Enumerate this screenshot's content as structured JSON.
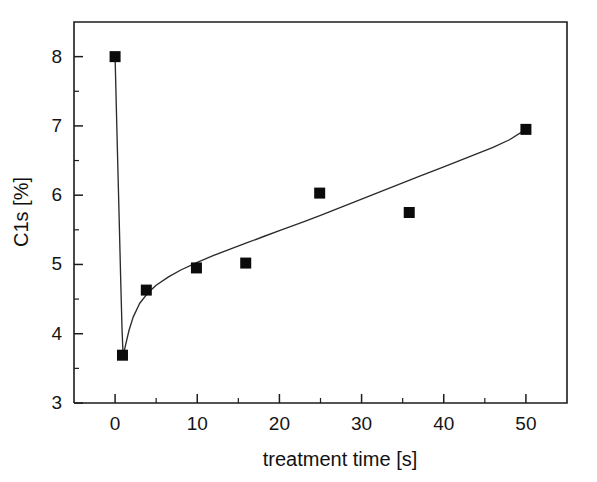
{
  "chart_data": {
    "type": "scatter",
    "title": "",
    "xlabel": "treatment time [s]",
    "ylabel": "C1s [%]",
    "xlim": [
      -5,
      55
    ],
    "ylim": [
      3,
      8.5
    ],
    "grid": false,
    "legend": null,
    "x_ticks": [
      0,
      10,
      20,
      30,
      40,
      50
    ],
    "x_tick_labels": [
      "0",
      "10",
      "20",
      "30",
      "40",
      "50"
    ],
    "x_minor_ticks": [
      5,
      15,
      25,
      35,
      45
    ],
    "y_ticks": [
      3,
      4,
      5,
      6,
      7,
      8
    ],
    "y_tick_labels": [
      "3",
      "4",
      "5",
      "6",
      "7",
      "8"
    ],
    "y_minor_ticks": [
      3.5,
      4.5,
      5.5,
      6.5,
      7.5
    ],
    "marker": "filled-square",
    "marker_color": "#0b0b0b",
    "line_color": "#2b2b2b",
    "points": [
      {
        "x": 0.0,
        "y": 8.0
      },
      {
        "x": 0.9,
        "y": 3.69
      },
      {
        "x": 3.8,
        "y": 4.63
      },
      {
        "x": 9.9,
        "y": 4.95
      },
      {
        "x": 15.9,
        "y": 5.02
      },
      {
        "x": 24.9,
        "y": 6.03
      },
      {
        "x": 35.8,
        "y": 5.75
      },
      {
        "x": 50.0,
        "y": 6.95
      }
    ],
    "fit_curve": [
      {
        "x": 0.0,
        "y": 8.0
      },
      {
        "x": 0.25,
        "y": 6.8
      },
      {
        "x": 0.5,
        "y": 5.65
      },
      {
        "x": 0.7,
        "y": 4.7
      },
      {
        "x": 0.85,
        "y": 4.05
      },
      {
        "x": 0.95,
        "y": 3.76
      },
      {
        "x": 1.0,
        "y": 3.69
      },
      {
        "x": 1.3,
        "y": 3.85
      },
      {
        "x": 1.7,
        "y": 4.05
      },
      {
        "x": 2.2,
        "y": 4.24
      },
      {
        "x": 3.0,
        "y": 4.44
      },
      {
        "x": 4.0,
        "y": 4.59
      },
      {
        "x": 5.0,
        "y": 4.7
      },
      {
        "x": 6.5,
        "y": 4.82
      },
      {
        "x": 8.0,
        "y": 4.92
      },
      {
        "x": 10.0,
        "y": 5.03
      },
      {
        "x": 12.0,
        "y": 5.13
      },
      {
        "x": 14.0,
        "y": 5.22
      },
      {
        "x": 16.0,
        "y": 5.31
      },
      {
        "x": 18.0,
        "y": 5.4
      },
      {
        "x": 20.0,
        "y": 5.49
      },
      {
        "x": 23.0,
        "y": 5.62
      },
      {
        "x": 25.0,
        "y": 5.71
      },
      {
        "x": 28.0,
        "y": 5.85
      },
      {
        "x": 31.0,
        "y": 5.99
      },
      {
        "x": 34.0,
        "y": 6.13
      },
      {
        "x": 37.0,
        "y": 6.27
      },
      {
        "x": 40.0,
        "y": 6.41
      },
      {
        "x": 43.0,
        "y": 6.55
      },
      {
        "x": 46.0,
        "y": 6.69
      },
      {
        "x": 48.0,
        "y": 6.8
      },
      {
        "x": 50.0,
        "y": 6.95
      }
    ]
  },
  "axes": {
    "x_title": "treatment time [s]",
    "y_title": "C1s [%]"
  }
}
